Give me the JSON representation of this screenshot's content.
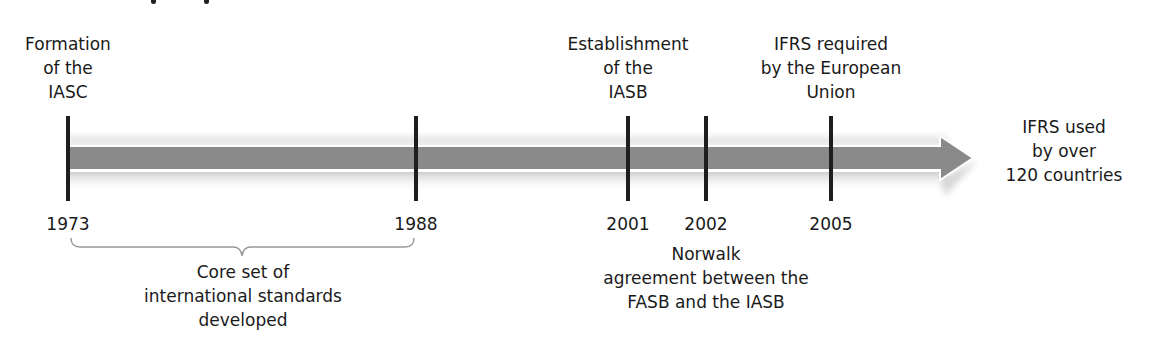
{
  "timeline": {
    "arrow_color": "#8a8a8a",
    "tick_color": "#1e1e1e",
    "events_above": [
      {
        "year": "1973",
        "lines": [
          "Formation",
          "of the",
          "IASC"
        ]
      },
      {
        "year": "2001",
        "lines": [
          "Establishment",
          "of the",
          "IASB"
        ]
      },
      {
        "year": "2005",
        "lines": [
          "IFRS required",
          "by the European",
          "Union"
        ]
      }
    ],
    "years": [
      "1973",
      "1988",
      "2001",
      "2002",
      "2005"
    ],
    "below_notes": {
      "core_standards": {
        "range": [
          "1973",
          "1988"
        ],
        "lines": [
          "Core set of",
          "international standards",
          "developed"
        ]
      },
      "norwalk": {
        "year": "2002",
        "lines": [
          "Norwalk",
          "agreement between the",
          "FASB and the IASB"
        ]
      }
    },
    "end_note": {
      "lines": [
        "IFRS used",
        "by over",
        "120 countries"
      ]
    }
  }
}
